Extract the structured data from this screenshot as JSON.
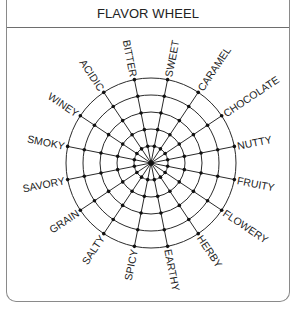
{
  "header": {
    "title": "FLAVOR WHEEL"
  },
  "wheel": {
    "center": [
      151,
      163
    ],
    "ring_count": 5,
    "outer_radius": 85,
    "line_color": "#2a2a2a",
    "dot_color": "#111111",
    "labels": [
      "BITTER",
      "SWEET",
      "CARAMEL",
      "CHOCOLATE",
      "NUTTY",
      "FRUITY",
      "FLOWERY",
      "HERBY",
      "EARTHY",
      "SPICY",
      "SALTY",
      "GRAIN",
      "SAVORY",
      "SMOKY",
      "WINEY",
      "ACIDIC"
    ]
  }
}
